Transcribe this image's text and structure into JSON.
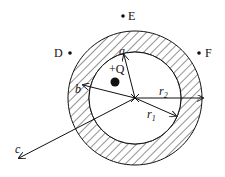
{
  "diagram": {
    "points": {
      "D": "D",
      "E": "E",
      "F": "F"
    },
    "charge_label": "+Q",
    "vectors": {
      "a": "a",
      "b": "b",
      "c": "c"
    },
    "radii": {
      "r1": "r",
      "r1_sub": "1",
      "r2": "r",
      "r2_sub": "2"
    },
    "colors": {
      "stroke": "#111111",
      "background": "#ffffff"
    }
  }
}
